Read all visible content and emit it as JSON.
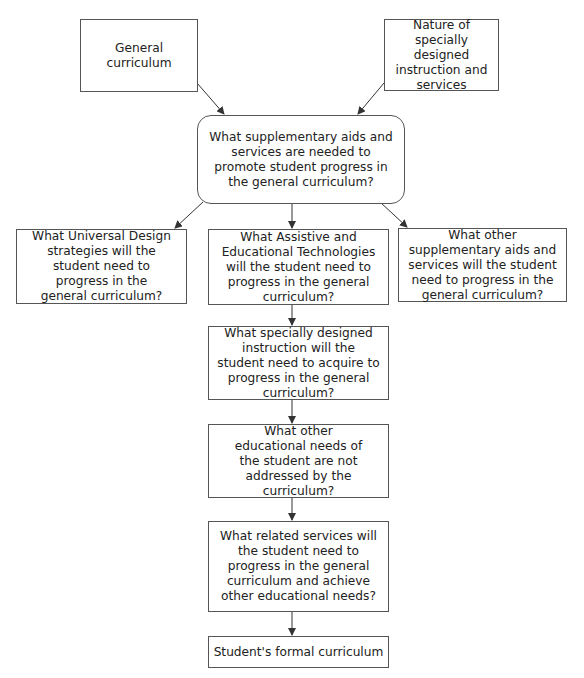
{
  "diagram": {
    "type": "flowchart",
    "colors": {
      "line": "#333333",
      "border": "#555555",
      "text": "#222222",
      "background": "#ffffff"
    },
    "nodes": {
      "general_curriculum": "General curriculum",
      "nature_sdi": "Nature of specially designed instruction and services",
      "supplementary_question": "What supplementary aids and services are needed to promote student progress in the general curriculum?",
      "universal_design": "What Universal Design strategies will the student need to progress in the general curriculum?",
      "assistive_tech": "What Assistive and Educational Technologies will the student need to progress in the general curriculum?",
      "other_supplementary": "What other supplementary aids and services will the student need to progress in the general curriculum?",
      "specially_designed": "What specially designed instruction will the student need to acquire to progress in the general curriculum?",
      "other_needs": "What other educational needs of the student are not addressed by the curriculum?",
      "related_services": "What related services will the student need to progress in the general curriculum and achieve other educational needs?",
      "formal_curriculum": "Student's formal curriculum"
    },
    "edges": [
      [
        "general_curriculum",
        "supplementary_question"
      ],
      [
        "nature_sdi",
        "supplementary_question"
      ],
      [
        "supplementary_question",
        "universal_design"
      ],
      [
        "supplementary_question",
        "assistive_tech"
      ],
      [
        "supplementary_question",
        "other_supplementary"
      ],
      [
        "assistive_tech",
        "specially_designed"
      ],
      [
        "specially_designed",
        "other_needs"
      ],
      [
        "other_needs",
        "related_services"
      ],
      [
        "related_services",
        "formal_curriculum"
      ]
    ]
  }
}
